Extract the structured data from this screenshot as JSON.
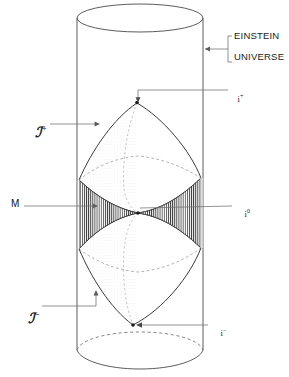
{
  "figure": {
    "title_region": {
      "einstein_label_line1": "EINSTEIN",
      "einstein_label_line2": "UNIVERSE"
    },
    "labels": {
      "scri_plus": "ℐ",
      "scri_plus_sup": "+",
      "scri_minus": "ℐ",
      "scri_minus_sup": "−",
      "minkowski": "M",
      "i_plus": "i",
      "i_plus_sup": "+",
      "i_zero": "i",
      "i_zero_sup": "0",
      "i_minus": "i",
      "i_minus_sup": "−"
    },
    "colors": {
      "ink": "#1c1c1c",
      "line": "#4a4a4a",
      "hatch": "#2e2e2e",
      "faint": "#b8b8b8",
      "paper": "#ffffff"
    },
    "geometry": {
      "cylinder_left_x": 77,
      "cylinder_right_x": 203,
      "cylinder_top_y": 18,
      "cylinder_bottom_y": 350,
      "ellipse_ry": 14,
      "i_plus_point": [
        137,
        102
      ],
      "i_minus_point": [
        133,
        325
      ],
      "i_zero_left": [
        79,
        213
      ],
      "i_zero_right": [
        201,
        204
      ],
      "center_point": [
        138,
        213
      ]
    }
  }
}
